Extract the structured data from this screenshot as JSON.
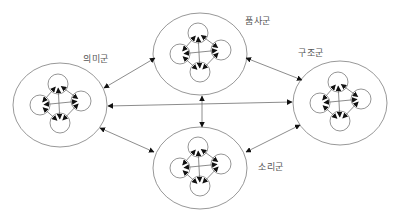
{
  "diagram": {
    "colors": {
      "outer": "#8c8c8c",
      "inner": "#7a7a7a",
      "arrow": "#6e6e6e",
      "arrowhead": "#111111",
      "label": "#555555"
    },
    "groups": [
      {
        "id": "meaning",
        "label": "의미군",
        "cx": 60,
        "cy": 105,
        "rx": 47,
        "ry": 42,
        "label_x": 83,
        "label_y": 52
      },
      {
        "id": "pos",
        "label": "품사군",
        "cx": 200,
        "cy": 54,
        "rx": 47,
        "ry": 41,
        "label_x": 245,
        "label_y": 14
      },
      {
        "id": "structure",
        "label": "구조군",
        "cx": 340,
        "cy": 103,
        "rx": 47,
        "ry": 42,
        "label_x": 298,
        "label_y": 46
      },
      {
        "id": "sound",
        "label": "소리군",
        "cx": 200,
        "cy": 168,
        "rx": 47,
        "ry": 41,
        "label_x": 258,
        "label_y": 160
      }
    ],
    "inner_offsets": [
      {
        "dx": -2,
        "dy": -21
      },
      {
        "dx": -20,
        "dy": 0
      },
      {
        "dx": 21,
        "dy": -4
      },
      {
        "dx": 0,
        "dy": 18
      }
    ],
    "inner_radius": 10,
    "connections": [
      {
        "from": "meaning",
        "to": "pos",
        "x1": 104,
        "y1": 88,
        "x2": 155,
        "y2": 58
      },
      {
        "from": "meaning",
        "to": "structure",
        "x1": 108,
        "y1": 106,
        "x2": 292,
        "y2": 102
      },
      {
        "from": "meaning",
        "to": "sound",
        "x1": 100,
        "y1": 128,
        "x2": 154,
        "y2": 152
      },
      {
        "from": "pos",
        "to": "structure",
        "x1": 246,
        "y1": 58,
        "x2": 302,
        "y2": 80
      },
      {
        "from": "pos",
        "to": "sound",
        "x1": 202,
        "y1": 96,
        "x2": 202,
        "y2": 127
      },
      {
        "from": "structure",
        "to": "sound",
        "x1": 300,
        "y1": 125,
        "x2": 246,
        "y2": 152
      }
    ]
  }
}
